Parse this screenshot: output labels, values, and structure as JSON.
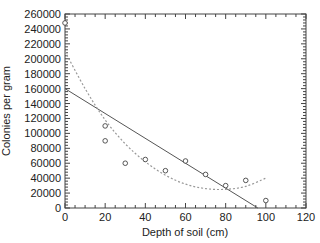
{
  "chart_data": {
    "type": "scatter",
    "title": "",
    "xlabel": "Depth of soil (cm)",
    "ylabel": "Colonies per gram",
    "xlim": [
      0,
      120
    ],
    "ylim": [
      0,
      260000
    ],
    "x_ticks": [
      0,
      20,
      40,
      60,
      80,
      100,
      120
    ],
    "y_ticks": [
      0,
      20000,
      40000,
      60000,
      80000,
      100000,
      120000,
      140000,
      160000,
      180000,
      200000,
      220000,
      240000,
      260000
    ],
    "grid": false,
    "legend": null,
    "series": [
      {
        "name": "Observed colonies",
        "type": "scatter",
        "marker": "open-circle",
        "x": [
          0,
          20,
          20,
          30,
          40,
          50,
          60,
          70,
          80,
          90,
          100
        ],
        "y": [
          248000,
          110000,
          90000,
          60000,
          65000,
          50000,
          63000,
          45000,
          30000,
          37000,
          10000
        ]
      },
      {
        "name": "Linear fit",
        "type": "line",
        "style": "solid",
        "x": [
          0,
          96
        ],
        "y": [
          160000,
          0
        ]
      },
      {
        "name": "Quadratic fit",
        "type": "line",
        "style": "dotted",
        "x": [
          0,
          10,
          20,
          30,
          40,
          50,
          60,
          70,
          80,
          90,
          100
        ],
        "y": [
          210000,
          160000,
          118000,
          86000,
          62000,
          44000,
          32000,
          26000,
          25000,
          29000,
          40000
        ]
      }
    ]
  }
}
